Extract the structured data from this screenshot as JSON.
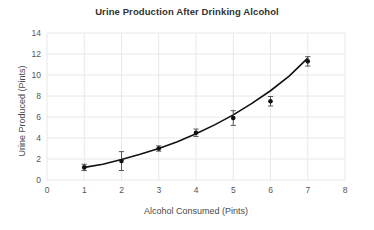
{
  "chart_data": {
    "type": "scatter",
    "title": "Urine Production After Drinking Alcohol",
    "xlabel": "Alcohol Consumed (Pints)",
    "ylabel": "Urine Produced (Pints)",
    "xlim": [
      0,
      8
    ],
    "ylim": [
      0,
      14
    ],
    "xticks": [
      0,
      1,
      2,
      3,
      4,
      5,
      6,
      7,
      8
    ],
    "yticks": [
      0,
      2,
      4,
      6,
      8,
      10,
      12,
      14
    ],
    "grid": true,
    "legend": "none",
    "marker_color": "#111111",
    "line_color": "#111111",
    "grid_color": "#e8e8e8",
    "x": [
      1,
      2,
      3,
      4,
      5,
      6,
      7
    ],
    "values": [
      1.2,
      1.8,
      3.0,
      4.5,
      5.9,
      7.5,
      11.3
    ],
    "errors": [
      0.3,
      0.9,
      0.25,
      0.35,
      0.7,
      0.45,
      0.45
    ],
    "series": [
      {
        "name": "Measured urine production",
        "x": [
          1,
          2,
          3,
          4,
          5,
          6,
          7
        ],
        "values": [
          1.2,
          1.8,
          3.0,
          4.5,
          5.9,
          7.5,
          11.3
        ],
        "errors": [
          0.3,
          0.9,
          0.25,
          0.35,
          0.7,
          0.45,
          0.45
        ]
      },
      {
        "name": "Fitted exponential trend curve",
        "x": [
          1.0,
          1.5,
          2.0,
          2.5,
          3.0,
          3.5,
          4.0,
          4.5,
          5.0,
          5.5,
          6.0,
          6.5,
          7.0
        ],
        "values": [
          1.2,
          1.5,
          1.95,
          2.45,
          3.0,
          3.65,
          4.4,
          5.25,
          6.2,
          7.3,
          8.5,
          9.9,
          11.6
        ]
      }
    ]
  },
  "ticks": {
    "y": [
      "14",
      "12",
      "10",
      "8",
      "6",
      "4",
      "2",
      "0"
    ],
    "x": [
      "0",
      "1",
      "2",
      "3",
      "4",
      "5",
      "6",
      "7",
      "8"
    ]
  }
}
